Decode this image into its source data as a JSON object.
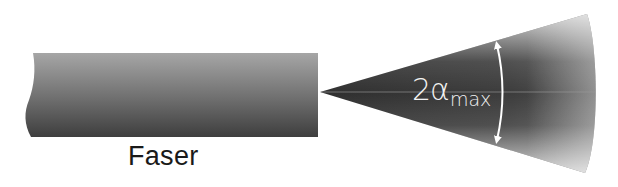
{
  "diagram": {
    "fiber": {
      "label": "Faser"
    },
    "cone": {
      "angle_label_main": "2α",
      "angle_label_subscript": "max"
    },
    "colors": {
      "fiber_top": "#a3a3a3",
      "fiber_bottom": "#3c3c3c",
      "cone_dark": "#3a3a3a",
      "cone_light": "#bdbdbd",
      "arrow": "#ffffff",
      "background": "#ffffff"
    }
  }
}
